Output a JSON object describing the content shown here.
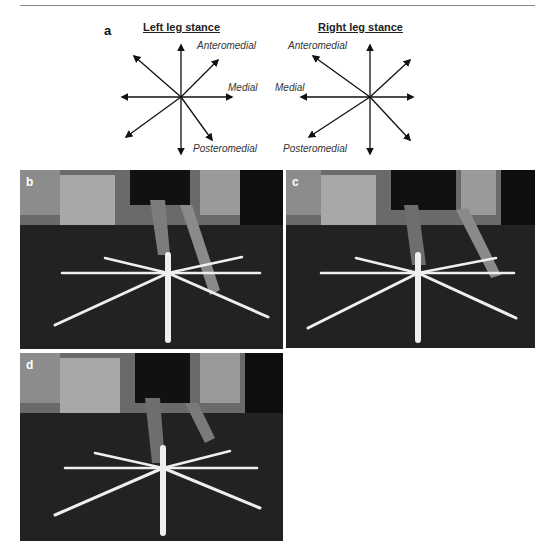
{
  "figure": {
    "panel_a": {
      "letter": "a",
      "left_diagram": {
        "title": "Left leg stance",
        "labels": {
          "anteromedial": "Anteromedial",
          "medial": "Medial",
          "posteromedial": "Posteromedial"
        },
        "arrow_directions": [
          "anterior",
          "anteromedial",
          "medial",
          "posteromedial",
          "posterior",
          "posterolateral",
          "lateral",
          "anterolateral"
        ]
      },
      "right_diagram": {
        "title": "Right leg stance",
        "labels": {
          "anteromedial": "Anteromedial",
          "medial": "Medial",
          "posteromedial": "Posteromedial"
        },
        "arrow_directions": [
          "anterior",
          "anteromedial",
          "medial",
          "posteromedial",
          "posterior",
          "posterolateral",
          "lateral",
          "anterolateral"
        ]
      }
    },
    "photos": [
      {
        "letter": "b",
        "description": "Star excursion reach - anteromedial direction"
      },
      {
        "letter": "c",
        "description": "Star excursion reach - medial direction"
      },
      {
        "letter": "d",
        "description": "Star excursion reach - posteromedial direction"
      }
    ],
    "colors": {
      "line": "#8a8a8a",
      "arrow": "#111111",
      "tape": "#f2f2f2",
      "floor": "#1b1b1b"
    }
  }
}
